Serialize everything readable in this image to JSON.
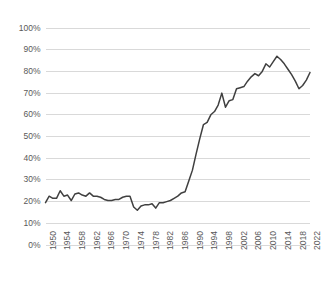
{
  "chart_data": {
    "type": "line",
    "title": "",
    "subtitle": "",
    "xlabel": "",
    "ylabel": "",
    "legend": [],
    "legend_position": "none",
    "grid": true,
    "grid_axis": "y",
    "xlim": [
      1950,
      2022
    ],
    "ylim": [
      0,
      1.0
    ],
    "ytick_labels": [
      "0%",
      "10%",
      "20%",
      "30%",
      "40%",
      "50%",
      "60%",
      "70%",
      "80%",
      "90%",
      "100%"
    ],
    "ytick_values": [
      0,
      0.1,
      0.2,
      0.3,
      0.4,
      0.5,
      0.6,
      0.7,
      0.8,
      0.9,
      1.0
    ],
    "xtick_labels": [
      "1950",
      "1954",
      "1958",
      "1962",
      "1966",
      "1970",
      "1974",
      "1978",
      "1982",
      "1986",
      "1990",
      "1994",
      "1998",
      "2002",
      "2006",
      "2010",
      "2014",
      "2018",
      "2022"
    ],
    "xtick_values": [
      1950,
      1954,
      1958,
      1962,
      1966,
      1970,
      1974,
      1978,
      1982,
      1986,
      1990,
      1994,
      1998,
      2002,
      2006,
      2010,
      2014,
      2018,
      2022
    ],
    "x": [
      1950,
      1951,
      1952,
      1953,
      1954,
      1955,
      1956,
      1957,
      1958,
      1959,
      1960,
      1961,
      1962,
      1963,
      1964,
      1965,
      1966,
      1967,
      1968,
      1969,
      1970,
      1971,
      1972,
      1973,
      1974,
      1975,
      1976,
      1977,
      1978,
      1979,
      1980,
      1981,
      1982,
      1983,
      1984,
      1985,
      1986,
      1987,
      1988,
      1989,
      1990,
      1991,
      1992,
      1993,
      1994,
      1995,
      1996,
      1997,
      1998,
      1999,
      2000,
      2001,
      2002,
      2003,
      2004,
      2005,
      2006,
      2007,
      2008,
      2009,
      2010,
      2011,
      2012,
      2013,
      2014,
      2015,
      2016,
      2017,
      2018,
      2019,
      2020,
      2021,
      2022
    ],
    "series": [
      {
        "name": "Series 1",
        "color": "#404040",
        "values": [
          0.195,
          0.225,
          0.215,
          0.215,
          0.25,
          0.225,
          0.23,
          0.205,
          0.235,
          0.24,
          0.23,
          0.225,
          0.24,
          0.225,
          0.225,
          0.22,
          0.21,
          0.205,
          0.205,
          0.21,
          0.21,
          0.22,
          0.225,
          0.225,
          0.175,
          0.16,
          0.18,
          0.185,
          0.185,
          0.19,
          0.17,
          0.195,
          0.195,
          0.2,
          0.205,
          0.215,
          0.225,
          0.24,
          0.245,
          0.295,
          0.345,
          0.42,
          0.49,
          0.555,
          0.565,
          0.6,
          0.615,
          0.645,
          0.7,
          0.635,
          0.665,
          0.67,
          0.72,
          0.725,
          0.73,
          0.755,
          0.775,
          0.79,
          0.78,
          0.8,
          0.835,
          0.82,
          0.845,
          0.87,
          0.855,
          0.835,
          0.81,
          0.785,
          0.755,
          0.72,
          0.735,
          0.76,
          0.795
        ]
      }
    ]
  },
  "axes": {
    "line_color": "#404040",
    "grid_color": "#d9d9d9",
    "tick_label_color": "#595959"
  }
}
